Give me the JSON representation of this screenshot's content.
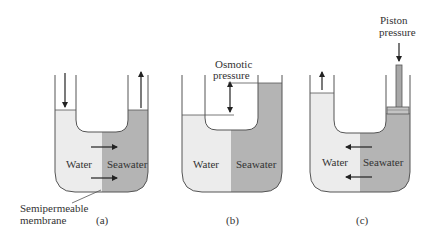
{
  "colors": {
    "water": "#ececec",
    "seawater": "#b4b4b4",
    "outline": "#555555",
    "arrow": "#222222",
    "piston": "#a8a8a8"
  },
  "panels": [
    {
      "id": "a",
      "caption": "(a)",
      "left_label": "Water",
      "right_label": "Seawater",
      "flow_direction": "water-to-seawater",
      "left_level_arrow": "down",
      "right_level_arrow": "up"
    },
    {
      "id": "b",
      "caption": "(b)",
      "left_label": "Water",
      "right_label": "Seawater",
      "annotation_line1": "Osmotic",
      "annotation_line2": "pressure",
      "flow_direction": "equilibrium"
    },
    {
      "id": "c",
      "caption": "(c)",
      "left_label": "Water",
      "right_label": "Seawater",
      "annotation_line1": "Piston",
      "annotation_line2": "pressure",
      "flow_direction": "seawater-to-water",
      "left_level_arrow": "up"
    }
  ],
  "membrane_label_line1": "Semipermeable",
  "membrane_label_line2": "membrane"
}
